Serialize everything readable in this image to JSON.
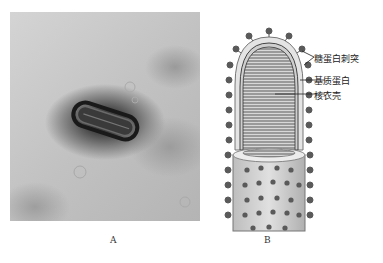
{
  "figure": {
    "panel_a": {
      "label": "A",
      "description": "Electron micrograph of bullet-shaped virus particle"
    },
    "panel_b": {
      "label": "B",
      "description": "Schematic of bullet-shaped virion structure",
      "annotations": [
        {
          "text": "糖蛋白刺突"
        },
        {
          "text": "基质蛋白"
        },
        {
          "text": "核衣壳"
        }
      ]
    },
    "caption": ""
  },
  "colors": {
    "background": "#ffffff",
    "spike": "#5a5a5a",
    "envelope": "#d8d8d8",
    "nucleocapsid": "#8a8a8a"
  }
}
